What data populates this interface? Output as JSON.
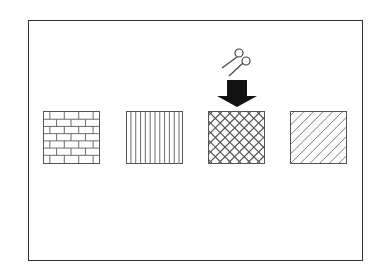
{
  "canvas": {
    "title": "Pattern fill selection",
    "swatches": [
      {
        "id": "brick",
        "label": "Brick pattern"
      },
      {
        "id": "vertical",
        "label": "Vertical lines pattern"
      },
      {
        "id": "crosshatch",
        "label": "Diagonal crosshatch pattern"
      },
      {
        "id": "diagonal",
        "label": "Diagonal lines pattern"
      }
    ],
    "selected_index": 2,
    "cursor": "scissors-icon",
    "colors": {
      "line": "#555555",
      "arrow": "#111111",
      "frame": "#333333"
    }
  }
}
